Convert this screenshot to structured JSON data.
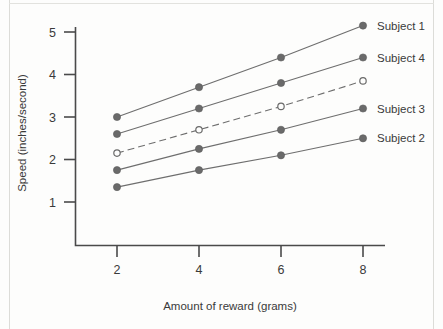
{
  "chart_data": {
    "type": "line",
    "title": "",
    "xlabel": "Amount of reward (grams)",
    "ylabel": "Speed (inches/second)",
    "x": [
      2,
      4,
      6,
      8
    ],
    "xticklabels": [
      "2",
      "4",
      "6",
      "8"
    ],
    "yticklabels": [
      "1",
      "2",
      "3",
      "4",
      "5"
    ],
    "yticks": [
      1,
      2,
      3,
      4,
      5
    ],
    "xlim": [
      1.2,
      8.8
    ],
    "ylim": [
      0.0,
      5.6
    ],
    "grid": false,
    "legend_position": "right-of-plot (inline end-of-line labels)",
    "series": [
      {
        "name": "Subject 1",
        "label": "Subject 1",
        "values": [
          3.0,
          3.7,
          4.4,
          5.15
        ],
        "marker": "filled-circle",
        "linestyle": "solid",
        "color": "#6a6a6a"
      },
      {
        "name": "Subject 4",
        "label": "Subject 4",
        "values": [
          2.6,
          3.2,
          3.8,
          4.4
        ],
        "marker": "filled-circle",
        "linestyle": "solid",
        "color": "#6a6a6a"
      },
      {
        "name": "unlabeled-dashed",
        "label": "",
        "values": [
          2.15,
          2.7,
          3.25,
          3.85
        ],
        "marker": "hollow-circle",
        "linestyle": "dashed",
        "color": "#6a6a6a"
      },
      {
        "name": "Subject 3",
        "label": "Subject 3",
        "values": [
          1.75,
          2.25,
          2.7,
          3.2
        ],
        "marker": "filled-circle",
        "linestyle": "solid",
        "color": "#6a6a6a"
      },
      {
        "name": "Subject 2",
        "label": "Subject 2",
        "values": [
          1.35,
          1.75,
          2.1,
          2.5
        ],
        "marker": "filled-circle",
        "linestyle": "solid",
        "color": "#6a6a6a"
      }
    ]
  },
  "labels": {
    "xaxis": "Amount of reward (grams)",
    "yaxis": "Speed (inches/second)",
    "xticks": [
      "2",
      "4",
      "6",
      "8"
    ],
    "yticks": [
      "1",
      "2",
      "3",
      "4",
      "5"
    ],
    "series": [
      "Subject 1",
      "Subject 4",
      "Subject 3",
      "Subject 2"
    ]
  },
  "colors": {
    "ink": "#3a3a3a",
    "line": "#6a6a6a",
    "axis": "#4a4a4a",
    "background": "#fdfdfc"
  }
}
